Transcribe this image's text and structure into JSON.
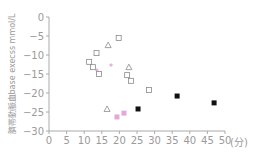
{
  "chart_data": {
    "type": "scatter",
    "title": "",
    "xlabel": "(分)",
    "ylabel": "臍帯動脈血base execss mmol/L",
    "xlim": [
      0,
      50
    ],
    "ylim": [
      -30,
      0
    ],
    "x_ticks": [
      0,
      5,
      10,
      15,
      20,
      25,
      30,
      35,
      40,
      45,
      50
    ],
    "y_ticks": [
      0,
      -5,
      -10,
      -15,
      -20,
      -25,
      -30
    ],
    "grid": false,
    "legend": null,
    "series": [
      {
        "name": "open-square",
        "marker": "square-open",
        "color": "#8a8a8a",
        "points": [
          [
            19.8,
            -5.5
          ],
          [
            13.5,
            -9.5
          ],
          [
            11.4,
            -11.8
          ],
          [
            12.5,
            -13.2
          ],
          [
            14.2,
            -15.0
          ],
          [
            22.2,
            -15.3
          ],
          [
            23.3,
            -16.8
          ],
          [
            28.4,
            -19.2
          ]
        ]
      },
      {
        "name": "open-triangle",
        "marker": "triangle-open",
        "color": "#8a8a8a",
        "points": [
          [
            16.8,
            -7.4
          ],
          [
            22.7,
            -13.2
          ],
          [
            16.5,
            -24.2
          ]
        ]
      },
      {
        "name": "pink-asterisk",
        "marker": "asterisk",
        "color": "#d48fd0",
        "points": [
          [
            17.6,
            -13.2
          ],
          [
            13.6,
            -14.5
          ]
        ]
      },
      {
        "name": "pink-square",
        "marker": "square-filled",
        "color": "#e0a8dc",
        "points": [
          [
            19.3,
            -26.3
          ],
          [
            21.3,
            -25.3
          ]
        ]
      },
      {
        "name": "black-square",
        "marker": "square-filled",
        "color": "#111111",
        "points": [
          [
            25.3,
            -24.2
          ],
          [
            36.4,
            -20.8
          ],
          [
            46.9,
            -22.6
          ]
        ]
      }
    ]
  }
}
